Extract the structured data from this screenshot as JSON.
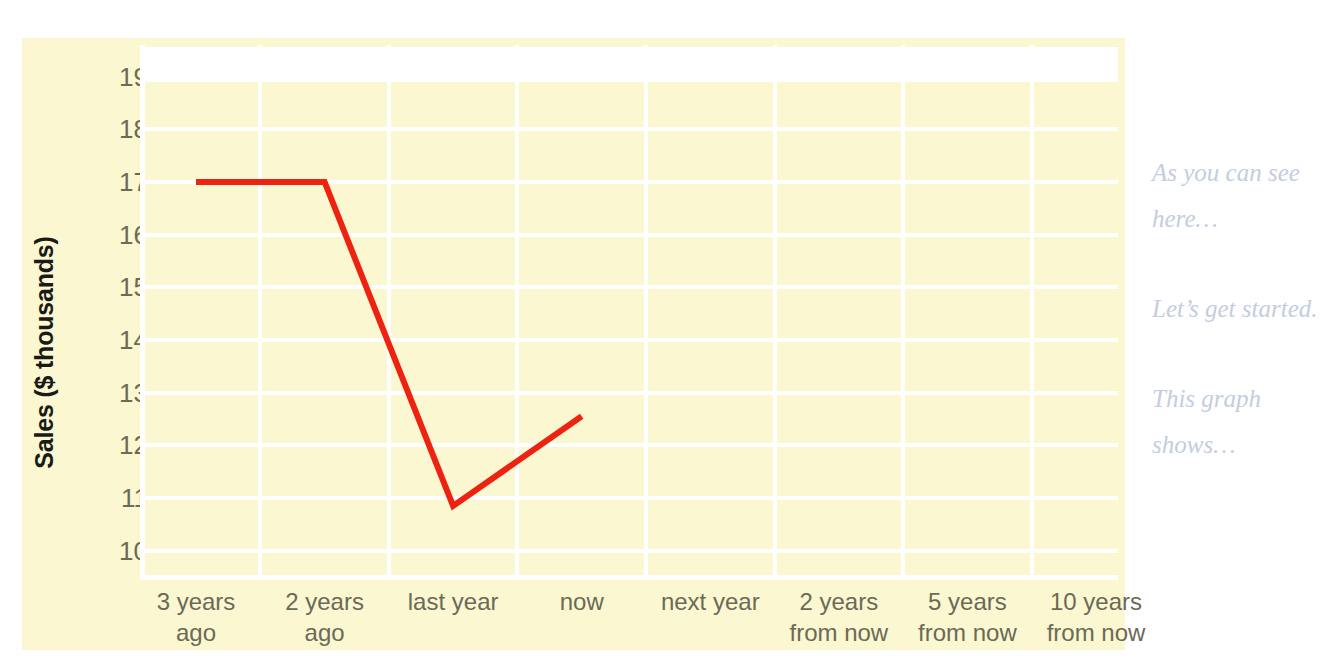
{
  "canvas": {
    "background_color": "#ffffff",
    "panel_color": "#faf7d1",
    "gridline_color": "#ffffff"
  },
  "chart_data": {
    "type": "line",
    "title": "",
    "subtitle": "",
    "xlabel": "",
    "ylabel": "Sales ($ thousands)",
    "categories": [
      "3 years ago",
      "2 years ago",
      "last year",
      "now",
      "next year",
      "2 years from now",
      "5 years from now",
      "10 years from now"
    ],
    "category_lines": [
      [
        "3 years",
        "ago"
      ],
      [
        "2 years",
        "ago"
      ],
      [
        "last year",
        ""
      ],
      [
        "now",
        ""
      ],
      [
        "next year",
        ""
      ],
      [
        "2 years",
        "from now"
      ],
      [
        "5 years",
        "from now"
      ],
      [
        "10 years",
        "from now"
      ]
    ],
    "series": [
      {
        "name": "Sales",
        "color": "#ee2211",
        "values": [
          17.0,
          17.0,
          10.85,
          12.55,
          null,
          null,
          null,
          null
        ]
      }
    ],
    "ylim": [
      9.5,
      19.6
    ],
    "y_ticks": [
      19,
      18,
      17,
      16,
      15,
      14,
      13,
      12,
      11,
      10
    ],
    "y_tick_labels": [
      "19",
      "18",
      "17",
      "16",
      "15",
      "14",
      "13",
      "12",
      "11",
      "10"
    ],
    "grid": {
      "horizontal": true,
      "vertical": true,
      "color": "#ffffff"
    },
    "legend": {
      "visible": false,
      "position": "none"
    },
    "annotations": []
  },
  "notes": [
    "As you can see here…",
    "Let’s get started.",
    "This graph shows…"
  ]
}
